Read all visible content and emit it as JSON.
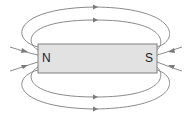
{
  "diagram": {
    "magnet": {
      "north_label": "N",
      "south_label": "S",
      "fill_color": "#e2e2e2",
      "border_color": "#7f7f7f"
    },
    "field_lines": {
      "color": "#8a8a8a",
      "direction": "from N (left) around to S (right) outside the magnet; arrows on top/bottom point right, arrows at ends point toward the magnet"
    }
  }
}
